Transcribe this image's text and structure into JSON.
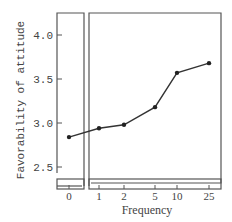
{
  "chart_data": {
    "type": "line",
    "title": "",
    "xlabel": "Frequency",
    "ylabel": "Favorability of attitude",
    "x": [
      0,
      1,
      2,
      5,
      10,
      25
    ],
    "categories": [
      "0",
      "1",
      "2",
      "5",
      "10",
      "25"
    ],
    "series": [
      {
        "name": "Favorability of attitude",
        "values": [
          2.84,
          2.94,
          2.98,
          3.18,
          3.57,
          3.68
        ]
      }
    ],
    "yticks": [
      "2.5",
      "3.0",
      "3.5",
      "4.0"
    ],
    "ylim": [
      2.43,
      4.22
    ],
    "grid": false,
    "legend": "none"
  },
  "axes": {
    "xlabel": "Frequency",
    "ylabel": "Favorability of attitude",
    "yticks": [
      {
        "label": "4.0",
        "value": 4.0
      },
      {
        "label": "3.5",
        "value": 3.5
      },
      {
        "label": "3.0",
        "value": 3.0
      },
      {
        "label": "2.5",
        "value": 2.5
      }
    ],
    "xticks": [
      {
        "label": "0",
        "px": 69
      },
      {
        "label": "1",
        "px": 99
      },
      {
        "label": "2",
        "px": 124
      },
      {
        "label": "5",
        "px": 155
      },
      {
        "label": "10",
        "px": 177
      },
      {
        "label": "25",
        "px": 209
      }
    ]
  },
  "colors": {
    "line": "#333333",
    "frame": "#555555",
    "text": "#444444"
  }
}
